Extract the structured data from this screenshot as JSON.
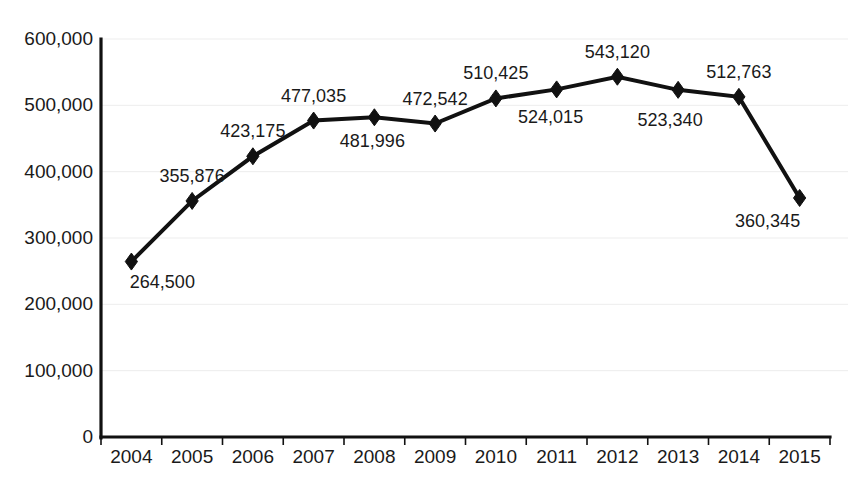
{
  "chart_data": {
    "type": "line",
    "title": "",
    "subtitle": "",
    "xlabel": "",
    "ylabel": "",
    "categories": [
      "2004",
      "2005",
      "2006",
      "2007",
      "2008",
      "2009",
      "2010",
      "2011",
      "2012",
      "2013",
      "2014",
      "2015"
    ],
    "values": [
      264500,
      355876,
      423175,
      477035,
      481996,
      472542,
      510425,
      524015,
      543120,
      523340,
      512763,
      360345
    ],
    "point_labels": [
      "264,500",
      "355,876",
      "423,175",
      "477,035",
      "481,996",
      "472,542",
      "510,425",
      "524,015",
      "543,120",
      "523,340",
      "512,763",
      "360,345"
    ],
    "point_label_positions": [
      "below",
      "above",
      "above",
      "above",
      "below",
      "above",
      "above",
      "below",
      "above",
      "below",
      "above",
      "below"
    ],
    "ylim": [
      0,
      600000
    ],
    "ytick_labels": [
      "0",
      "100,000",
      "200,000",
      "300,000",
      "400,000",
      "500,000",
      "600,000"
    ],
    "ytick_values": [
      0,
      100000,
      200000,
      300000,
      400000,
      500000,
      600000
    ],
    "grid": true,
    "grid_axis": "y",
    "legend": "none",
    "marker": "diamond",
    "series_color": "#111111",
    "grid_color": "#ededed",
    "axis_color": "#111111",
    "background_color": "#ffffff"
  }
}
